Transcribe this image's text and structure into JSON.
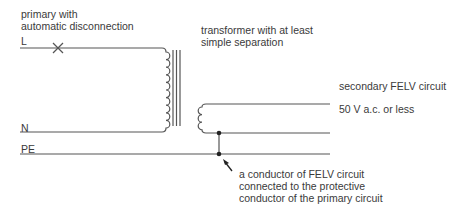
{
  "labels": {
    "primary": [
      "primary with",
      "automatic disconnection"
    ],
    "transformer": [
      "transformer with at least",
      "simple separation"
    ],
    "secondary": "secondary FELV circuit",
    "voltage": "50 V a.c. or less",
    "line_L": "L",
    "line_N": "N",
    "line_PE": "PE",
    "annotation": [
      "a conductor of FELV circuit",
      "connected to the protective",
      "conductor of the primary circuit"
    ]
  },
  "colors": {
    "line": "#555555",
    "text": "#3a3a3a"
  }
}
